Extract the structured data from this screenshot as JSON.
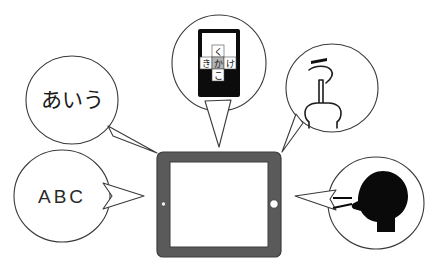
{
  "figure": {
    "background_color": "#ffffff",
    "outline_color": "#3a3a3a",
    "device_color": "#5a5a5a",
    "silhouette_color": "#0a0a0a",
    "key_active_color": "#b4b4b4"
  },
  "bubbles": {
    "kana_text": {
      "name": "kana-text-bubble",
      "label": "あいう",
      "tail_direction": "down-right"
    },
    "flick_keyboard": {
      "name": "flick-keyboard-bubble",
      "tail_direction": "down",
      "phone": {
        "keys": {
          "center": "か",
          "up": "く",
          "left": "き",
          "right": "け",
          "down": "こ"
        },
        "active_key": "か"
      }
    },
    "handwriting": {
      "name": "handwriting-bubble",
      "label": "う",
      "tail_direction": "down-left",
      "icon": "pointing-hand-icon"
    },
    "alphabet": {
      "name": "alphabet-bubble",
      "label": "ABC",
      "tail_direction": "right"
    },
    "voice": {
      "name": "voice-input-bubble",
      "tail_direction": "left",
      "icon": "speaking-head-icon"
    }
  },
  "device": {
    "name": "tablet",
    "screen_color": "#ffffff",
    "bezel_color": "#5a5a5a",
    "has_home_button": true,
    "has_camera_dot": true
  }
}
